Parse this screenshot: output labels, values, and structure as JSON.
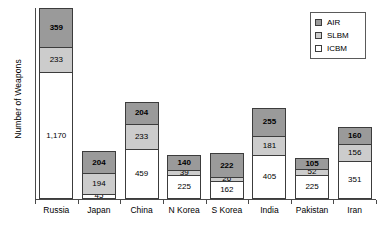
{
  "chart_data": {
    "type": "bar",
    "subtype": "stacked-vertical",
    "title": "",
    "xlabel": "",
    "ylabel": "Number of Weapons",
    "ylim": [
      0,
      1762
    ],
    "grid": false,
    "axis_tick_labels": [],
    "legend_position": "top-right",
    "categories": [
      "Russia",
      "Japan",
      "China",
      "N Korea",
      "S Korea",
      "India",
      "Pakistan",
      "Iran"
    ],
    "series": [
      {
        "name": "ICBM",
        "color": "#ffffff",
        "values": [
          1170,
          45,
          459,
          225,
          162,
          405,
          225,
          351
        ],
        "labels": [
          "1,170",
          "45",
          "459",
          "225",
          "162",
          "405",
          "225",
          "351"
        ]
      },
      {
        "name": "SLBM",
        "color": "#cccccc",
        "values": [
          233,
          194,
          233,
          39,
          26,
          181,
          52,
          156
        ],
        "labels": [
          "233",
          "194",
          "233",
          "39",
          "26",
          "181",
          "52",
          "156"
        ]
      },
      {
        "name": "AIR",
        "color": "#9a9a9a",
        "values": [
          359,
          204,
          204,
          140,
          222,
          255,
          105,
          160
        ],
        "labels": [
          "359",
          "204",
          "204",
          "140",
          "222",
          "255",
          "105",
          "160"
        ]
      }
    ],
    "totals": [
      1762,
      443,
      896,
      404,
      410,
      841,
      382,
      667
    ]
  },
  "legend": {
    "items": [
      {
        "label": "AIR",
        "color": "#9a9a9a"
      },
      {
        "label": "SLBM",
        "color": "#cccccc"
      },
      {
        "label": "ICBM",
        "color": "#ffffff"
      }
    ]
  },
  "axes": {
    "y_title": "Number of Weapons"
  }
}
